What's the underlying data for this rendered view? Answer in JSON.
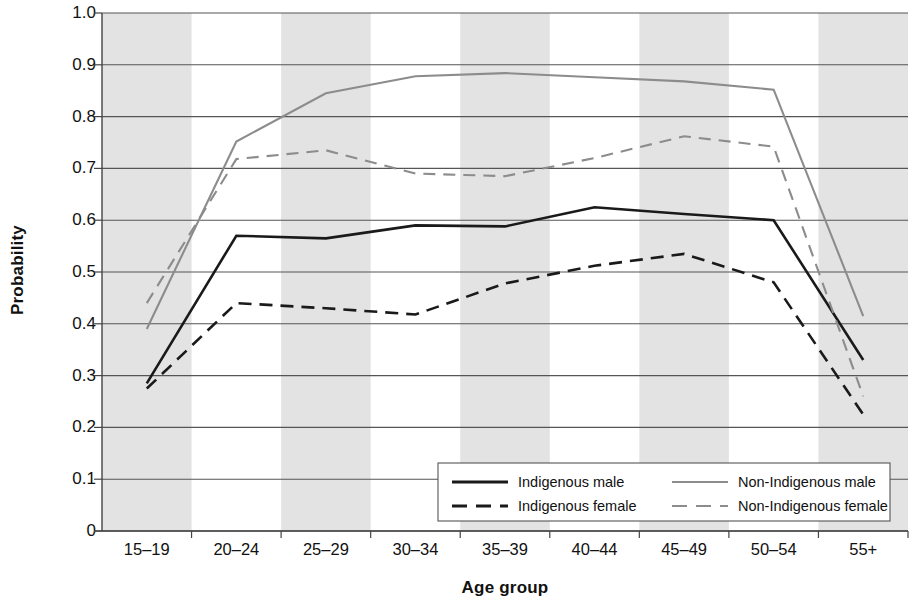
{
  "chart_data": {
    "type": "line",
    "title": "",
    "xlabel": "Age group",
    "ylabel": "Probability",
    "categories": [
      "15–19",
      "20–24",
      "25–29",
      "30–34",
      "35–39",
      "40–44",
      "45–49",
      "50–54",
      "55+"
    ],
    "ylim": [
      0,
      1.0
    ],
    "yticks": [
      "1.0",
      "0.9",
      "0.8",
      "0.7",
      "0.6",
      "0.5",
      "0.4",
      "0.3",
      "0.2",
      "0.1",
      "0"
    ],
    "ytick_values": [
      1.0,
      0.9,
      0.8,
      0.7,
      0.6,
      0.5,
      0.4,
      0.3,
      0.2,
      0.1,
      0
    ],
    "grid": "horizontal",
    "banding": "alternating vertical gray bands, shaded on odd categories",
    "legend_position": "inside bottom-right",
    "series": [
      {
        "name": "Indigenous male",
        "style": "solid",
        "color": "#1a1a1a",
        "values": [
          0.285,
          0.57,
          0.565,
          0.59,
          0.588,
          0.625,
          0.612,
          0.6,
          0.33
        ]
      },
      {
        "name": "Indigenous female",
        "style": "dashed",
        "color": "#1a1a1a",
        "values": [
          0.275,
          0.44,
          0.43,
          0.418,
          0.478,
          0.512,
          0.535,
          0.48,
          0.225
        ]
      },
      {
        "name": "Non-Indigenous male",
        "style": "solid",
        "color": "#8c8c8c",
        "values": [
          0.39,
          0.752,
          0.845,
          0.878,
          0.884,
          0.876,
          0.868,
          0.852,
          0.415
        ]
      },
      {
        "name": "Non-Indigenous female",
        "style": "dashed",
        "color": "#8c8c8c",
        "values": [
          0.44,
          0.718,
          0.735,
          0.69,
          0.685,
          0.72,
          0.762,
          0.742,
          0.26
        ]
      }
    ]
  },
  "axes": {
    "y_title": "Probability",
    "x_title": "Age group"
  },
  "legend": {
    "items": [
      {
        "label": "Indigenous male",
        "style": "solid",
        "color": "#1a1a1a"
      },
      {
        "label": "Indigenous female",
        "style": "dashed",
        "color": "#1a1a1a"
      },
      {
        "label": "Non-Indigenous male",
        "style": "solid",
        "color": "#8c8c8c"
      },
      {
        "label": "Non-Indigenous female",
        "style": "dashed",
        "color": "#8c8c8c"
      }
    ]
  },
  "colors": {
    "indigenous": "#1a1a1a",
    "non_indigenous": "#8c8c8c",
    "band": "#e3e3e3",
    "grid": "#555555"
  }
}
